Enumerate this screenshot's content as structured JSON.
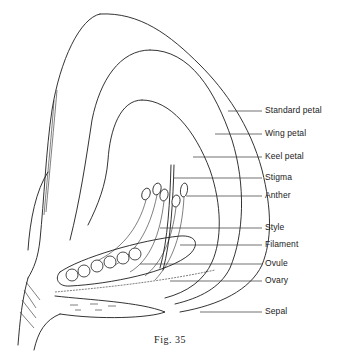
{
  "figure": {
    "caption": "Fig. 35",
    "labels": [
      {
        "id": "standard-petal",
        "text": "Standard petal"
      },
      {
        "id": "wing-petal",
        "text": "Wing petal"
      },
      {
        "id": "keel-petal",
        "text": "Keel petal"
      },
      {
        "id": "stigma",
        "text": "Stigma"
      },
      {
        "id": "anther",
        "text": "Anther"
      },
      {
        "id": "style",
        "text": "Style"
      },
      {
        "id": "filament",
        "text": "Filament"
      },
      {
        "id": "ovule",
        "text": "Ovule"
      },
      {
        "id": "ovary",
        "text": "Ovary"
      },
      {
        "id": "sepal",
        "text": "Sepal"
      }
    ]
  }
}
